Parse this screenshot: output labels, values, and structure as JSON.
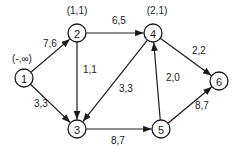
{
  "diagram": {
    "type": "directed network flow graph",
    "line_color": "#1a1a1a",
    "background": "#ffffff",
    "nodes": [
      {
        "id": "1",
        "label": "1",
        "x": 24,
        "y": 78,
        "tag": "(-,∞)",
        "tag_x": 22,
        "tag_y": 62
      },
      {
        "id": "2",
        "label": "2",
        "x": 77,
        "y": 33,
        "tag": "(1,1)",
        "tag_x": 77,
        "tag_y": 14
      },
      {
        "id": "3",
        "label": "3",
        "x": 77,
        "y": 129,
        "tag": "",
        "tag_x": 0,
        "tag_y": 0
      },
      {
        "id": "4",
        "label": "4",
        "x": 153,
        "y": 33,
        "tag": "(2,1)",
        "tag_x": 157,
        "tag_y": 14
      },
      {
        "id": "5",
        "label": "5",
        "x": 161,
        "y": 129,
        "tag": "",
        "tag_x": 0,
        "tag_y": 0
      },
      {
        "id": "6",
        "label": "6",
        "x": 219,
        "y": 81,
        "tag": "",
        "tag_x": 0,
        "tag_y": 0
      }
    ],
    "edges": [
      {
        "from": "1",
        "to": "2",
        "label": "7,6",
        "lx": 43,
        "ly": 47
      },
      {
        "from": "1",
        "to": "3",
        "label": "3,3",
        "lx": 34,
        "ly": 107
      },
      {
        "from": "2",
        "to": "4",
        "label": "6,5",
        "lx": 112,
        "ly": 24
      },
      {
        "from": "2",
        "to": "3",
        "label": "1,1",
        "lx": 83,
        "ly": 73
      },
      {
        "from": "4",
        "to": "3",
        "label": "3,3",
        "lx": 119,
        "ly": 92
      },
      {
        "from": "4",
        "to": "6",
        "label": "2,2",
        "lx": 192,
        "ly": 54
      },
      {
        "from": "5",
        "to": "4",
        "label": "2,0",
        "lx": 166,
        "ly": 81
      },
      {
        "from": "3",
        "to": "5",
        "label": "8,7",
        "lx": 111,
        "ly": 144
      },
      {
        "from": "5",
        "to": "6",
        "label": "8,7",
        "lx": 195,
        "ly": 109
      }
    ]
  }
}
